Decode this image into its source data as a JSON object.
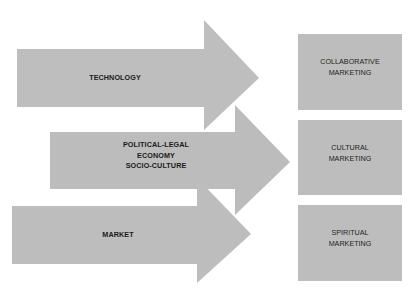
{
  "colors": {
    "arrow_fill": "#bebebe",
    "box_fill": "#bdbdbd",
    "text": "#1a1a1a",
    "background": "#ffffff"
  },
  "arrows": [
    {
      "id": "technology",
      "lines": [
        "TECHNOLOGY"
      ]
    },
    {
      "id": "political-economy-socio",
      "lines": [
        "POLITICAL-LEGAL",
        "ECONOMY",
        "SOCIO-CULTURE"
      ]
    },
    {
      "id": "market",
      "lines": [
        "MARKET"
      ]
    }
  ],
  "boxes": [
    {
      "id": "collaborative",
      "lines": [
        "COLLABORATIVE",
        "MARKETING"
      ]
    },
    {
      "id": "cultural",
      "lines": [
        "CULTURAL",
        "MARKETING"
      ]
    },
    {
      "id": "spiritual",
      "lines": [
        "SPIRITUAL",
        "MARKETING"
      ]
    }
  ]
}
